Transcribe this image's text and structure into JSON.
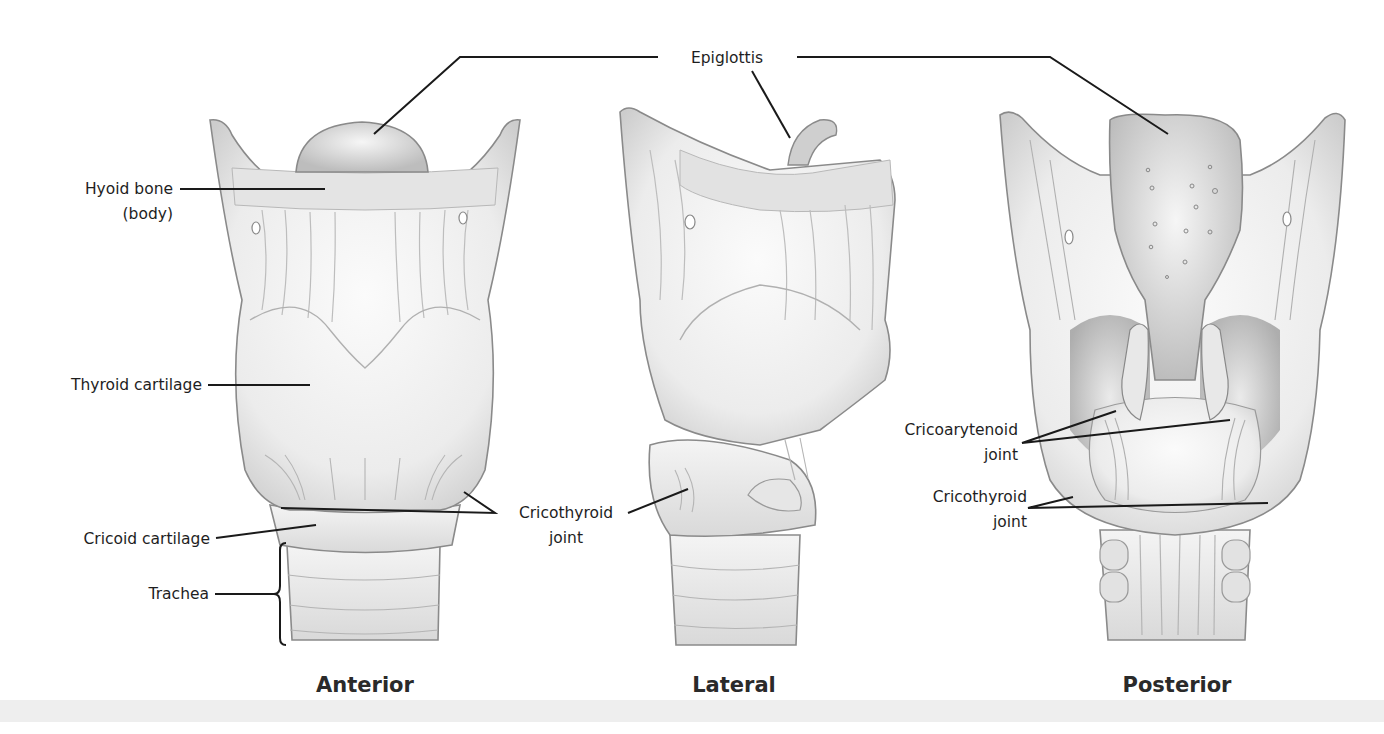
{
  "figure": {
    "views": [
      {
        "id": "anterior",
        "caption": "Anterior"
      },
      {
        "id": "lateral",
        "caption": "Lateral"
      },
      {
        "id": "posterior",
        "caption": "Posterior"
      }
    ],
    "labels": {
      "epiglottis": "Epiglottis",
      "hyoid_line1": "Hyoid bone",
      "hyoid_line2": "(body)",
      "thyroid": "Thyroid cartilage",
      "cricoid": "Cricoid cartilage",
      "trachea": "Trachea",
      "cricothyroid_a_line1": "Cricothyroid",
      "cricothyroid_a_line2": "joint",
      "cricoarytenoid_line1": "Cricoarytenoid",
      "cricoarytenoid_line2": "joint",
      "cricothyroid_p_line1": "Cricothyroid",
      "cricothyroid_p_line2": "joint"
    },
    "colors": {
      "background": "#ffffff",
      "line": "#1a1a1a",
      "cartilage": "#efefef",
      "shade": "#cfcfcf",
      "deep_shade": "#a9a9a9",
      "band": "#eeeeee"
    }
  }
}
